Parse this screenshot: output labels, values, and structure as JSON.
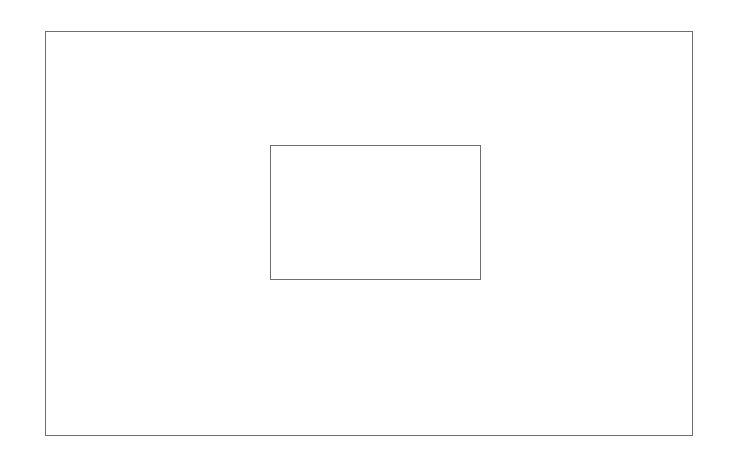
{
  "diagram": {
    "background": "#ffffff",
    "shapes": [
      {
        "id": "outer-rectangle",
        "type": "rectangle",
        "x": 45,
        "y": 31,
        "width": 648,
        "height": 405,
        "stroke": "#6e6e6e",
        "stroke_width": 1.5,
        "fill": "none"
      },
      {
        "id": "inner-rectangle",
        "type": "rectangle",
        "x": 270,
        "y": 145,
        "width": 211,
        "height": 135,
        "stroke": "#6e6e6e",
        "stroke_width": 1.5,
        "fill": "none"
      }
    ]
  }
}
